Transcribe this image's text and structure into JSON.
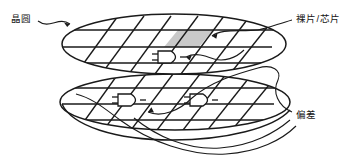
{
  "figure": {
    "type": "technical-line-diagram",
    "background_color": "#ffffff",
    "stroke_color": "#1a1a1a",
    "die_fill_color": "#c9c9c9"
  },
  "labels": {
    "wafer": "晶圆",
    "die_chip": "裸片/芯片",
    "deviation": "偏差"
  },
  "annotations": [
    {
      "name": "wafer",
      "text": "晶圆",
      "position": "top-left",
      "points_to": "upper-wafer-edge"
    },
    {
      "name": "die-chip",
      "text": "裸片/芯片",
      "position": "top-right",
      "points_to": "shaded-die-cell"
    },
    {
      "name": "deviation",
      "text": "偏差",
      "position": "bottom-right",
      "points_to": "lower-wafer-die-grid"
    }
  ],
  "geometry": {
    "wafers": [
      {
        "name": "upper-wafer",
        "cx": 174,
        "cy": 44,
        "rx": 112,
        "ry": 30
      },
      {
        "name": "lower-wafer",
        "cx": 175,
        "cy": 102,
        "rx": 115,
        "ry": 28
      }
    ],
    "shaded_die": {
      "name": "highlighted-die",
      "fill": "#c9c9c9"
    },
    "gate_symbols": [
      {
        "name": "gate-upper-1",
        "x": 166,
        "y": 57
      },
      {
        "name": "gate-lower-1",
        "x": 128,
        "y": 100
      },
      {
        "name": "gate-lower-2",
        "x": 200,
        "y": 100
      }
    ],
    "grid": {
      "horizontal_line_count": 6,
      "diagonal_line_count": 10,
      "diagonal_angle_deg": -62
    }
  }
}
